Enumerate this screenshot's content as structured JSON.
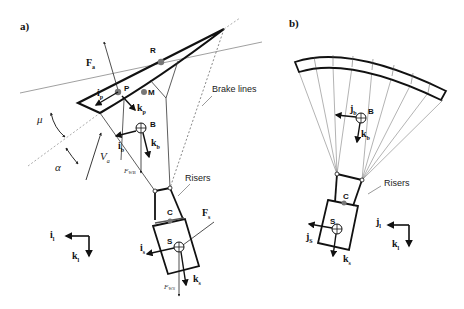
{
  "panels": {
    "a": {
      "label": "a)",
      "points": {
        "R": "R",
        "P": "P",
        "M": "M",
        "B": "B",
        "C": "C",
        "S": "S"
      },
      "vectors": {
        "Fa": {
          "main": "F",
          "sub": "a"
        },
        "ip": {
          "main": "i",
          "sub": "p"
        },
        "kp": {
          "main": "k",
          "sub": "p"
        },
        "ib": {
          "main": "i",
          "sub": "b"
        },
        "kb": {
          "main": "k",
          "sub": "b"
        },
        "is": {
          "main": "i",
          "sub": "s"
        },
        "ks": {
          "main": "k",
          "sub": "s"
        },
        "Fs": {
          "main": "F",
          "sub": "s"
        },
        "il": {
          "main": "i",
          "sub": "l"
        },
        "kl": {
          "main": "k",
          "sub": "l"
        },
        "Va": {
          "main": "V",
          "sub": "a"
        }
      },
      "angles": {
        "mu": "μ",
        "alpha": "α"
      },
      "forces": {
        "FWB": "F",
        "FWB_sub": "WB",
        "FWS": "F",
        "FWS_sub": "WS"
      },
      "annotations": {
        "brake_lines": "Brake lines",
        "risers": "Risers"
      }
    },
    "b": {
      "label": "b)",
      "points": {
        "B": "B",
        "C": "C",
        "S": "S"
      },
      "vectors": {
        "jb": {
          "main": "j",
          "sub": "b"
        },
        "kb": {
          "main": "k",
          "sub": "b"
        },
        "jS": {
          "main": "j",
          "sub": "S"
        },
        "ks": {
          "main": "k",
          "sub": "s"
        },
        "jl": {
          "main": "j",
          "sub": "l"
        },
        "kl": {
          "main": "k",
          "sub": "l"
        }
      },
      "annotations": {
        "risers": "Risers"
      }
    }
  },
  "colors": {
    "stroke": "#111111",
    "thin": "#555555",
    "point": "#777777",
    "bg": "#ffffff"
  }
}
